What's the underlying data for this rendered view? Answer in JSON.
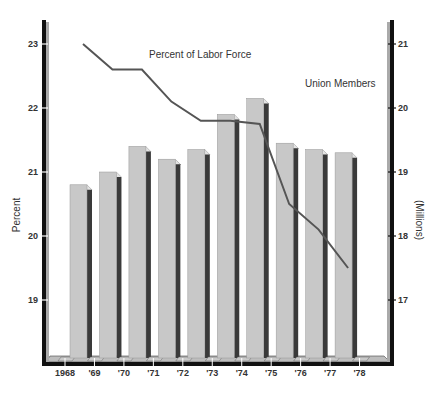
{
  "chart_data": {
    "type": "bar",
    "title": "",
    "categories": [
      "1968",
      "'69",
      "'70",
      "'71",
      "'72",
      "'73",
      "'74",
      "'75",
      "'76",
      "'77",
      "'78"
    ],
    "series": [
      {
        "name": "Union Members",
        "type": "bar",
        "axis": "right",
        "unit": "Millions",
        "values": [
          18.8,
          19.0,
          19.4,
          19.2,
          19.35,
          19.9,
          20.15,
          19.45,
          19.35,
          19.3,
          null
        ]
      },
      {
        "name": "Percent of Labor Force",
        "type": "line",
        "axis": "left",
        "unit": "Percent",
        "values": [
          23.0,
          22.6,
          22.6,
          22.1,
          21.8,
          21.8,
          21.75,
          20.5,
          20.1,
          19.5,
          null
        ]
      }
    ],
    "left_axis": {
      "label": "Percent",
      "ticks": [
        "19",
        "20",
        "21",
        "22",
        "23"
      ],
      "range": [
        18.0,
        23.4
      ]
    },
    "right_axis": {
      "label": "(Millions)",
      "ticks": [
        "17",
        "18",
        "19",
        "20",
        "21"
      ],
      "range": [
        16.0,
        21.4
      ]
    },
    "xlabel": "",
    "grid": false,
    "legend": "inline labels near series (top-center)",
    "colors": {
      "bar_face": "#c8c8c8",
      "bar_side": "#3a3a3a",
      "line": "#555555",
      "axis": "#111111"
    }
  }
}
